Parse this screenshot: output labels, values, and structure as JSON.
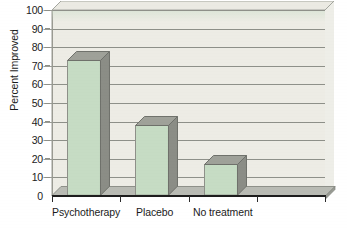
{
  "chart_data": {
    "type": "bar",
    "title": "",
    "xlabel": "",
    "ylabel": "Percent Improved",
    "categories": [
      "Psychotherapy",
      "Placebo",
      "No treatment"
    ],
    "values": [
      73,
      38,
      17
    ],
    "ylim": [
      0,
      100
    ],
    "ytick_interval": 10,
    "yticks": [
      100,
      90,
      80,
      70,
      60,
      50,
      40,
      30,
      20,
      10,
      0
    ],
    "ytick_labels": [
      "100",
      "90",
      "80",
      "70",
      "60",
      "50",
      "40",
      "30",
      "20",
      "10",
      "0"
    ],
    "grid": true,
    "grid_axis": "y",
    "legend": false,
    "legend_position": "none",
    "style": "3d-bar",
    "empty_category_slots": 1,
    "series": [
      {
        "name": "Percent Improved",
        "values": [
          73,
          38,
          17
        ]
      }
    ],
    "bars": [
      {
        "category": "Psychotherapy",
        "value": 73
      },
      {
        "category": "Placebo",
        "value": 38
      },
      {
        "category": "No treatment",
        "value": 17
      }
    ],
    "colors": {
      "bar_front": "#c6dcc4",
      "bar_side": "#8b8d86",
      "bar_top": "#9fa199",
      "bar_outline": "#8e9089",
      "plot_background": "#edece5",
      "plot_back_wall": "#eeeee8",
      "gridline": "#8e9089",
      "axis_line": "#1d1d1d",
      "floor": "#a9aba4",
      "text": "#1b1b1b",
      "page_background": "#ffffff"
    }
  }
}
